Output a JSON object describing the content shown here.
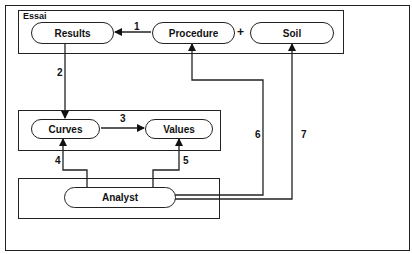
{
  "diagram": {
    "groups": {
      "essai": "Essai"
    },
    "nodes": {
      "results": "Results",
      "procedure": "Procedure",
      "soil": "Soil",
      "curves": "Curves",
      "values": "Values",
      "analyst": "Analyst"
    },
    "operators": {
      "plus": "+"
    },
    "edges": [
      {
        "id": "1",
        "label": "1",
        "from": "Procedure",
        "to": "Results"
      },
      {
        "id": "2",
        "label": "2",
        "from": "Results",
        "to": "Curves"
      },
      {
        "id": "3",
        "label": "3",
        "from": "Curves",
        "to": "Values"
      },
      {
        "id": "4",
        "label": "4",
        "from": "Analyst",
        "to": "Curves"
      },
      {
        "id": "5",
        "label": "5",
        "from": "Analyst",
        "to": "Values"
      },
      {
        "id": "6",
        "label": "6",
        "from": "Analyst",
        "to": "Procedure"
      },
      {
        "id": "7",
        "label": "7",
        "from": "Analyst",
        "to": "Soil"
      }
    ],
    "colors": {
      "stroke": "#222222",
      "background": "#ffffff"
    }
  }
}
